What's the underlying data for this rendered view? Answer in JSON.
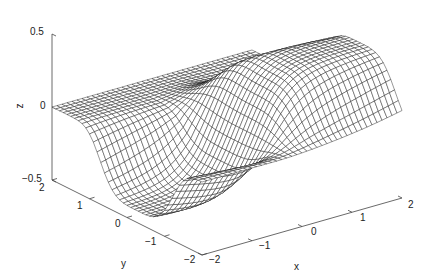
{
  "chart_data": {
    "type": "surface-mesh",
    "title": "",
    "xlabel": "x",
    "ylabel": "y",
    "zlabel": "z",
    "xlim": [
      -2,
      2
    ],
    "ylim": [
      -2,
      2
    ],
    "zlim": [
      -0.5,
      0.5
    ],
    "xticks": [
      -2,
      -1,
      0,
      1,
      2
    ],
    "yticks": [
      -2,
      -1,
      0,
      1,
      2
    ],
    "zticks": [
      -0.5,
      0,
      0.5
    ],
    "xtick_labels": [
      "−2",
      "−1",
      "0",
      "1",
      "2"
    ],
    "ytick_labels": [
      "−2",
      "−1",
      "0",
      "1",
      "2"
    ],
    "ztick_labels": [
      "−0.5",
      "0",
      "0.5"
    ],
    "grid": false,
    "mesh_resolution": 41,
    "mesh_color": "#1a1a1a",
    "face_color": "#ffffff"
  }
}
